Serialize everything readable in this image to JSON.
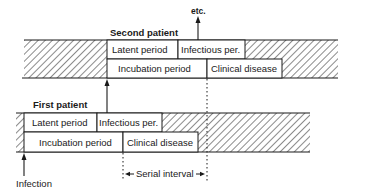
{
  "diagram": {
    "title_top": "etc.",
    "second_patient": {
      "label": "Second patient",
      "row1": [
        {
          "label": "Latent period"
        },
        {
          "label": "Infectious per."
        }
      ],
      "row2": [
        {
          "label": "Incubation period"
        },
        {
          "label": "Clinical disease"
        }
      ]
    },
    "first_patient": {
      "label": "First patient",
      "row1": [
        {
          "label": "Latent period"
        },
        {
          "label": "Infectious per."
        }
      ],
      "row2": [
        {
          "label": "Incubation period"
        },
        {
          "label": "Clinical disease"
        }
      ]
    },
    "infection_label": "Infection",
    "serial_interval_label": "Serial interval",
    "colors": {
      "line": "#1a1a1a",
      "hatch": "#2a2a2a",
      "background": "#ffffff"
    }
  }
}
